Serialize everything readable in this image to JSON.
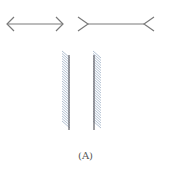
{
  "figure": {
    "caption": "(A)",
    "illusions": [
      {
        "name": "muller-lyer-inward",
        "description": "Line with inward-pointing arrowheads"
      },
      {
        "name": "muller-lyer-outward",
        "description": "Line with outward-pointing fins"
      },
      {
        "name": "hatched-parallel-lines",
        "description": "Two vertical parallel lines with oblique hatching"
      }
    ],
    "colors": {
      "line": "#777777",
      "hatch": "#a9b9cc"
    }
  }
}
